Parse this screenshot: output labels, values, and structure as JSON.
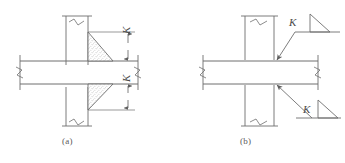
{
  "figure": {
    "type": "engineering-detail-drawing",
    "line_color": "#6e6e6e",
    "hatch_color": "#9a9a9a",
    "text_color": "#4a4a4a",
    "background": "#ffffff"
  },
  "panels": [
    {
      "id": "a",
      "caption": "(a)",
      "style": "section-hatched-weld",
      "notes": "Fillet welds drawn as stippled triangles at beam flange to column face; size dimension K shown with vertical dimension lines and arrowheads",
      "dimensions": [
        {
          "id": "k-upper",
          "label": "K",
          "orientation": "vertical"
        },
        {
          "id": "k-lower",
          "label": "K",
          "orientation": "vertical"
        }
      ]
    },
    {
      "id": "b",
      "caption": "(b)",
      "style": "weld-symbol-notation",
      "notes": "Same connection annotated with standard fillet weld symbols: leader line with arrowhead, horizontal reference line and triangle, weld size K",
      "weld_symbols": [
        {
          "id": "weld-upper",
          "label": "K",
          "symbol": "fillet-weld-triangle",
          "arrow_target": "beam-top-flange-to-column"
        },
        {
          "id": "weld-lower",
          "label": "K",
          "symbol": "fillet-weld-triangle",
          "arrow_target": "beam-bottom-flange-to-column"
        }
      ]
    }
  ],
  "labels": {
    "caption_a": "(a)",
    "caption_b": "(b)",
    "k_a_upper": "K",
    "k_a_lower": "K",
    "k_b_upper": "K",
    "k_b_lower": "K"
  }
}
